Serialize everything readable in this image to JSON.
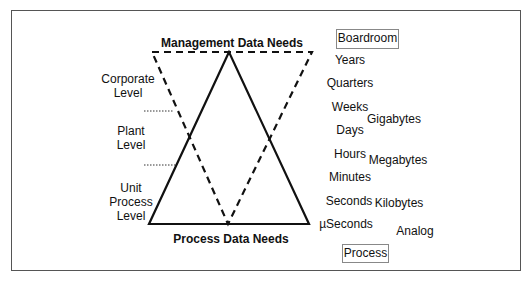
{
  "diagram": {
    "top_label": "Management Data Needs",
    "bottom_label": "Process Data Needs",
    "top_box": "Boardroom",
    "bottom_box": "Process",
    "levels": [
      {
        "line1": "Corporate",
        "line2": "Level"
      },
      {
        "line1": "Plant",
        "line2": "Level"
      },
      {
        "line1": "Unit",
        "line2": "Process",
        "line3": "Level"
      }
    ],
    "time_scale": [
      "Years",
      "Quarters",
      "Weeks",
      "Days",
      "Hours",
      "Minutes",
      "Seconds",
      "µSeconds"
    ],
    "data_sizes": [
      "Gigabytes",
      "Megabytes",
      "Kilobytes",
      "Analog"
    ],
    "shapes": {
      "solid_triangle": "upright triangle, apex at top (management) widening to base (process)",
      "dashed_inverted_triangle": "inverted triangle, wide at top (management) narrowing to point at base (process)"
    },
    "colors": {
      "line": "#111111",
      "frame": "#555555",
      "box_border": "#888888",
      "background": "#ffffff"
    }
  }
}
